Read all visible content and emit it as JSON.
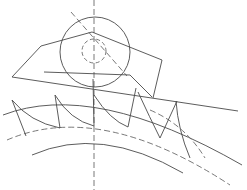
{
  "diagram": {
    "title": "Hob cutter generating gear teeth",
    "colors": {
      "line": "#4a4a4a",
      "centerline": "#6a6a6a",
      "background": "#ffffff"
    },
    "elements": [
      "vertical-centerline",
      "hob-outer-circle",
      "hob-bore-circle",
      "tilted-axis-line",
      "hob-profile-polygon",
      "rack-line",
      "gear-addendum-arc",
      "gear-pitch-circle",
      "gear-root-arc",
      "gear-teeth"
    ]
  }
}
